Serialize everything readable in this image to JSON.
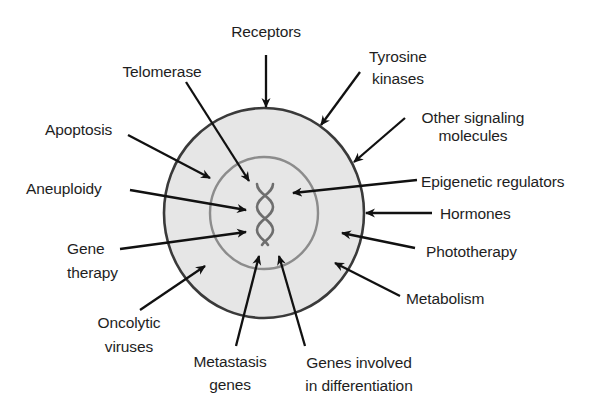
{
  "diagram": {
    "colors": {
      "outer_fill": "#e6e6e6",
      "outer_stroke": "#3a3a3a",
      "inner_stroke": "#8c8c8c",
      "dna_stroke": "#6e6e6e",
      "arrow": "#111111",
      "text": "#1e1e1e"
    },
    "shapes": {
      "outer_ellipse": {
        "cx": 264,
        "cy": 213,
        "rx": 100,
        "ry": 105
      },
      "inner_circle": {
        "cx": 264,
        "cy": 213,
        "rx": 54,
        "ry": 56
      },
      "dna_helix": {
        "x": 256,
        "y": 183,
        "width": 18,
        "height": 62
      }
    },
    "labels": [
      {
        "id": "receptors",
        "lines": [
          "Receptors"
        ]
      },
      {
        "id": "telomerase",
        "lines": [
          "Telomerase"
        ]
      },
      {
        "id": "tyrosine-kinases",
        "lines": [
          "Tyrosine",
          "kinases"
        ]
      },
      {
        "id": "other-signaling-molecules",
        "lines": [
          "Other signaling",
          "molecules"
        ]
      },
      {
        "id": "apoptosis",
        "lines": [
          "Apoptosis"
        ]
      },
      {
        "id": "epigenetic-regulators",
        "lines": [
          "Epigenetic regulators"
        ]
      },
      {
        "id": "aneuploidy",
        "lines": [
          "Aneuploidy"
        ]
      },
      {
        "id": "hormones",
        "lines": [
          "Hormones"
        ]
      },
      {
        "id": "gene-therapy",
        "lines": [
          "Gene",
          "therapy"
        ]
      },
      {
        "id": "phototherapy",
        "lines": [
          "Phototherapy"
        ]
      },
      {
        "id": "metabolism",
        "lines": [
          "Metabolism"
        ]
      },
      {
        "id": "oncolytic-viruses",
        "lines": [
          "Oncolytic",
          "viruses"
        ]
      },
      {
        "id": "metastasis-genes",
        "lines": [
          "Metastasis",
          "genes"
        ]
      },
      {
        "id": "genes-involved-in-differentiation",
        "lines": [
          "Genes involved",
          "in differentiation"
        ]
      }
    ],
    "arrows": [
      {
        "id": "receptors",
        "from": [
          266,
          55
        ],
        "to": [
          266,
          107
        ]
      },
      {
        "id": "telomerase",
        "from": [
          186,
          82
        ],
        "to": [
          249,
          181
        ]
      },
      {
        "id": "tyrosine-kinases",
        "from": [
          360,
          72
        ],
        "to": [
          321,
          125
        ]
      },
      {
        "id": "other-signaling-molecules",
        "from": [
          405,
          118
        ],
        "to": [
          354,
          162
        ]
      },
      {
        "id": "apoptosis",
        "from": [
          128,
          135
        ],
        "to": [
          210,
          178
        ]
      },
      {
        "id": "epigenetic-regulators",
        "from": [
          417,
          180
        ],
        "to": [
          293,
          193
        ]
      },
      {
        "id": "aneuploidy",
        "from": [
          130,
          190
        ],
        "to": [
          246,
          210
        ]
      },
      {
        "id": "hormones",
        "from": [
          432,
          213
        ],
        "to": [
          366,
          213
        ]
      },
      {
        "id": "gene-therapy",
        "from": [
          120,
          249
        ],
        "to": [
          246,
          232
        ]
      },
      {
        "id": "phototherapy",
        "from": [
          415,
          248
        ],
        "to": [
          342,
          233
        ]
      },
      {
        "id": "metabolism",
        "from": [
          400,
          296
        ],
        "to": [
          335,
          263
        ]
      },
      {
        "id": "oncolytic-viruses",
        "from": [
          140,
          310
        ],
        "to": [
          205,
          266
        ]
      },
      {
        "id": "metastasis-genes",
        "from": [
          236,
          346
        ],
        "to": [
          259,
          256
        ]
      },
      {
        "id": "genes-involved-in-differentiation",
        "from": [
          305,
          346
        ],
        "to": [
          279,
          256
        ]
      }
    ]
  },
  "text": {
    "receptors": "Receptors",
    "telomerase": "Telomerase",
    "tyrosine_1": "Tyrosine",
    "tyrosine_2": "kinases",
    "other_1": "Other signaling",
    "other_2": "molecules",
    "apoptosis": "Apoptosis",
    "epigenetic": "Epigenetic regulators",
    "aneuploidy": "Aneuploidy",
    "hormones": "Hormones",
    "gene_1": "Gene",
    "gene_2": "therapy",
    "phototherapy": "Phototherapy",
    "metabolism": "Metabolism",
    "oncolytic_1": "Oncolytic",
    "oncolytic_2": "viruses",
    "metastasis_1": "Metastasis",
    "metastasis_2": "genes",
    "diff_1": "Genes involved",
    "diff_2": "in differentiation"
  }
}
